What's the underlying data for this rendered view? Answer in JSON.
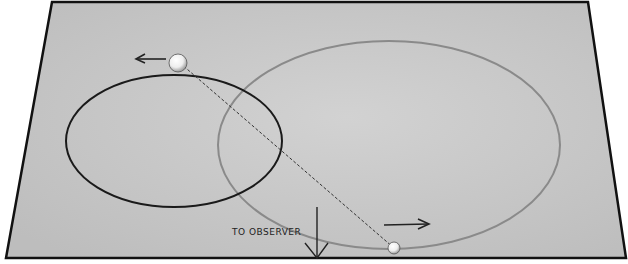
{
  "diagram": {
    "label_observer": "TO OBSERVER",
    "plane": {
      "fill": "#c9c9c9",
      "border": "#111111"
    },
    "orbits": [
      {
        "name": "small-orbit",
        "color": "#1a1a1a"
      },
      {
        "name": "large-orbit",
        "color": "#8a8a8a"
      }
    ],
    "stars": [
      {
        "name": "star-upper-left",
        "direction": "left"
      },
      {
        "name": "star-lower-right",
        "direction": "right"
      }
    ]
  }
}
